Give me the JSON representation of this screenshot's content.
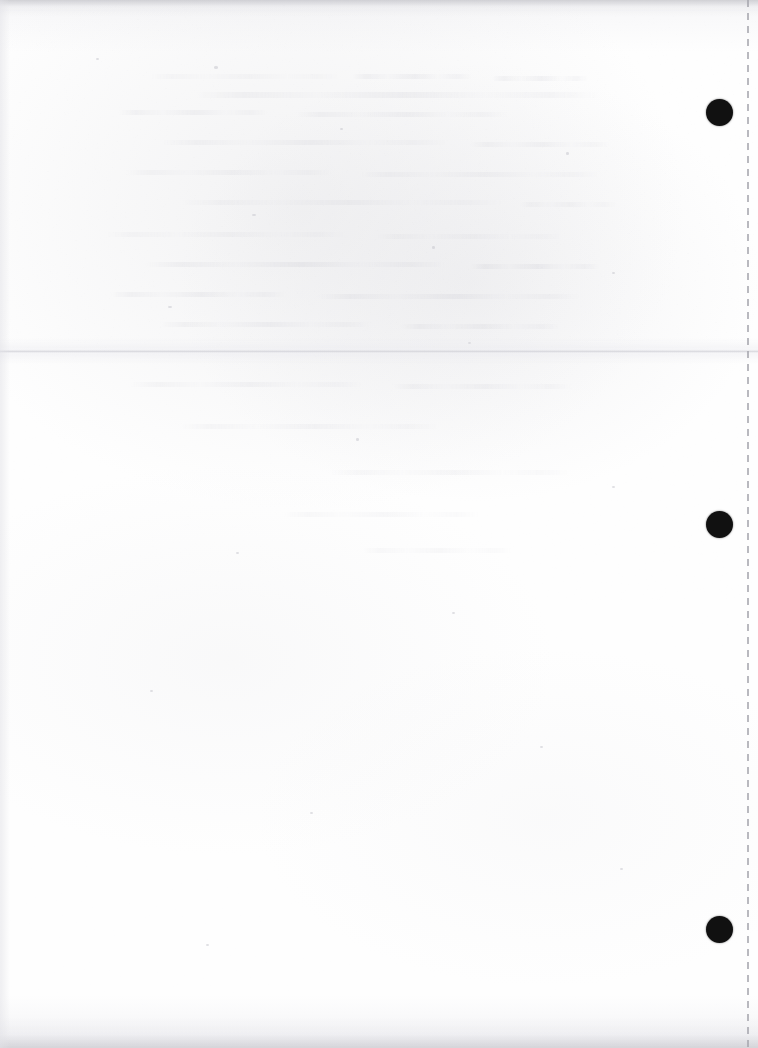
{
  "page": {
    "kind": "scanned-blank-page",
    "width": 758,
    "height": 1048,
    "background_color": "#fefefe",
    "paper_tone_color": "#f6f6f8",
    "content_text": "",
    "note_label": ""
  },
  "marks": {
    "punch_dots": [
      {
        "name": "punch-dot-top",
        "x": 719,
        "y": 112,
        "diameter": 27,
        "color": "#111111"
      },
      {
        "name": "punch-dot-middle",
        "x": 719,
        "y": 524,
        "diameter": 27,
        "color": "#111111"
      },
      {
        "name": "punch-dot-bottom",
        "x": 719,
        "y": 929,
        "diameter": 27,
        "color": "#111111"
      }
    ],
    "perforation": {
      "name": "perforation-line",
      "x": 747,
      "dash_length": 7,
      "gap_length": 6,
      "color": "#a8a8af"
    },
    "fold_crease": {
      "name": "fold-crease",
      "y": 350,
      "color": "#cdcdd3"
    }
  },
  "ghost_impressions": [
    {
      "x": 150,
      "y": 74,
      "width": 190,
      "height": 5
    },
    {
      "x": 352,
      "y": 74,
      "width": 120,
      "height": 5
    },
    {
      "x": 492,
      "y": 76,
      "width": 96,
      "height": 5
    },
    {
      "x": 196,
      "y": 92,
      "width": 402,
      "height": 6
    },
    {
      "x": 118,
      "y": 110,
      "width": 150,
      "height": 5
    },
    {
      "x": 296,
      "y": 112,
      "width": 212,
      "height": 5
    },
    {
      "x": 162,
      "y": 140,
      "width": 286,
      "height": 5
    },
    {
      "x": 470,
      "y": 142,
      "width": 140,
      "height": 5
    },
    {
      "x": 126,
      "y": 170,
      "width": 206,
      "height": 5
    },
    {
      "x": 360,
      "y": 172,
      "width": 240,
      "height": 5
    },
    {
      "x": 182,
      "y": 200,
      "width": 320,
      "height": 5
    },
    {
      "x": 520,
      "y": 202,
      "width": 96,
      "height": 5
    },
    {
      "x": 104,
      "y": 232,
      "width": 242,
      "height": 5
    },
    {
      "x": 376,
      "y": 234,
      "width": 186,
      "height": 5
    },
    {
      "x": 146,
      "y": 262,
      "width": 300,
      "height": 5
    },
    {
      "x": 470,
      "y": 264,
      "width": 130,
      "height": 5
    },
    {
      "x": 110,
      "y": 292,
      "width": 176,
      "height": 5
    },
    {
      "x": 318,
      "y": 294,
      "width": 262,
      "height": 5
    },
    {
      "x": 160,
      "y": 322,
      "width": 210,
      "height": 5
    },
    {
      "x": 400,
      "y": 324,
      "width": 160,
      "height": 5
    },
    {
      "x": 130,
      "y": 382,
      "width": 232,
      "height": 5
    },
    {
      "x": 392,
      "y": 384,
      "width": 180,
      "height": 5
    },
    {
      "x": 180,
      "y": 424,
      "width": 260,
      "height": 5
    },
    {
      "x": 330,
      "y": 470,
      "width": 240,
      "height": 5
    },
    {
      "x": 284,
      "y": 512,
      "width": 196,
      "height": 5
    },
    {
      "x": 362,
      "y": 548,
      "width": 150,
      "height": 5
    }
  ],
  "specks": [
    {
      "x": 96,
      "y": 58,
      "w": 3,
      "h": 2
    },
    {
      "x": 214,
      "y": 66,
      "w": 4,
      "h": 3
    },
    {
      "x": 340,
      "y": 128,
      "w": 3,
      "h": 2
    },
    {
      "x": 566,
      "y": 152,
      "w": 3,
      "h": 3
    },
    {
      "x": 252,
      "y": 214,
      "w": 4,
      "h": 2
    },
    {
      "x": 432,
      "y": 246,
      "w": 3,
      "h": 3
    },
    {
      "x": 612,
      "y": 272,
      "w": 3,
      "h": 2
    },
    {
      "x": 168,
      "y": 306,
      "w": 4,
      "h": 2
    },
    {
      "x": 468,
      "y": 342,
      "w": 3,
      "h": 2
    },
    {
      "x": 356,
      "y": 438,
      "w": 3,
      "h": 3
    },
    {
      "x": 612,
      "y": 486,
      "w": 3,
      "h": 2
    },
    {
      "x": 236,
      "y": 552,
      "w": 3,
      "h": 2
    },
    {
      "x": 452,
      "y": 612,
      "w": 3,
      "h": 2
    },
    {
      "x": 150,
      "y": 690,
      "w": 3,
      "h": 2
    },
    {
      "x": 540,
      "y": 746,
      "w": 3,
      "h": 2
    },
    {
      "x": 310,
      "y": 812,
      "w": 3,
      "h": 2
    },
    {
      "x": 620,
      "y": 868,
      "w": 3,
      "h": 2
    },
    {
      "x": 206,
      "y": 944,
      "w": 3,
      "h": 2
    }
  ]
}
